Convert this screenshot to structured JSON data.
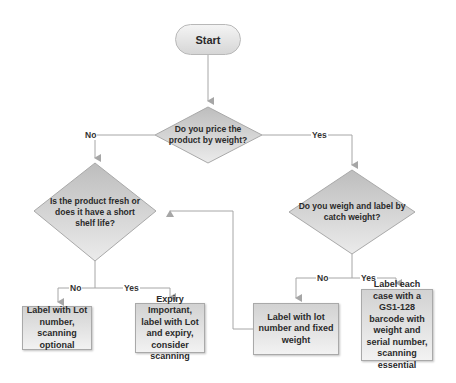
{
  "diagram": {
    "type": "flowchart",
    "colors": {
      "shape_fill": "#d8d8d8",
      "line": "#a6a6a6",
      "text": "#2a2a2a"
    },
    "nodes": {
      "start": {
        "label": "Start",
        "shape": "terminator"
      },
      "q_price": {
        "label": "Do you price the product by weight?",
        "shape": "decision"
      },
      "q_fresh": {
        "label": "Is the product fresh or does it have a short shelf life?",
        "shape": "decision"
      },
      "q_catch": {
        "label": "Do you weigh and label by catch weight?",
        "shape": "decision"
      },
      "r_lot_optional": {
        "label": "Label with Lot number, scanning optional",
        "shape": "process"
      },
      "r_expiry": {
        "label": "Expiry Important, label with Lot and expiry, consider scanning",
        "shape": "process"
      },
      "r_fixed": {
        "label": "Label with lot number and fixed weight",
        "shape": "process"
      },
      "r_gs1": {
        "label": "Label each case with a GS1-128 barcode with weight and serial number, scanning essential",
        "shape": "process"
      }
    },
    "edges": {
      "price_no": "No",
      "price_yes": "Yes",
      "fresh_no": "No",
      "fresh_yes": "Yes",
      "catch_no": "No",
      "catch_yes": "Yes"
    }
  }
}
